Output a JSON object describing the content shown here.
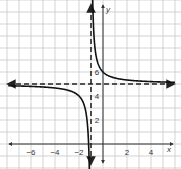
{
  "chart_data": {
    "type": "line",
    "title": "",
    "xlabel": "x",
    "ylabel": "y",
    "xlim": [
      -8.2,
      6.3
    ],
    "ylim": [
      -1.5,
      12.5
    ],
    "grid": true,
    "x_ticks": [
      -6,
      -4,
      -2,
      2,
      4
    ],
    "x_tick_labels": [
      "−6",
      "−4",
      "−2",
      "2",
      "4"
    ],
    "y_ticks": [
      2,
      4,
      6
    ],
    "y_tick_labels": [
      "2",
      "4",
      "6"
    ],
    "series": [
      {
        "name": "y = 1/(x+1) + 5",
        "style": "solid",
        "branches": [
          {
            "x": [
              -8,
              -6,
              -4,
              -3,
              -2,
              -1.5,
              -1.25,
              -1.1
            ],
            "y": [
              4.86,
              4.8,
              4.67,
              4.5,
              4,
              3,
              1,
              -5
            ]
          },
          {
            "x": [
              -0.9,
              -0.75,
              -0.5,
              0,
              1,
              2,
              4,
              6
            ],
            "y": [
              15,
              9,
              7,
              6,
              5.5,
              5.33,
              5.2,
              5.14
            ]
          }
        ]
      }
    ],
    "asymptotes": [
      {
        "type": "vertical",
        "x": -1,
        "style": "dashed"
      },
      {
        "type": "horizontal",
        "y": 5,
        "style": "dashed"
      }
    ],
    "annotations": []
  },
  "axes": {
    "x_label": "x",
    "y_label": "y"
  }
}
